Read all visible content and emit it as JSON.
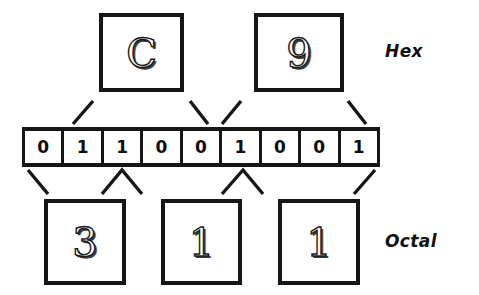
{
  "diagram": {
    "ink_color": "#161616",
    "background_color": "#ffffff"
  },
  "bits": {
    "label": "binary-bit-string",
    "values": [
      "0",
      "1",
      "1",
      "0",
      "0",
      "1",
      "0",
      "0",
      "1"
    ]
  },
  "hex": {
    "label": "Hex",
    "digits": [
      {
        "value": "C"
      },
      {
        "value": "9"
      }
    ]
  },
  "octal": {
    "label": "Octal",
    "digits": [
      {
        "value": "3"
      },
      {
        "value": "1"
      },
      {
        "value": "1"
      }
    ]
  }
}
